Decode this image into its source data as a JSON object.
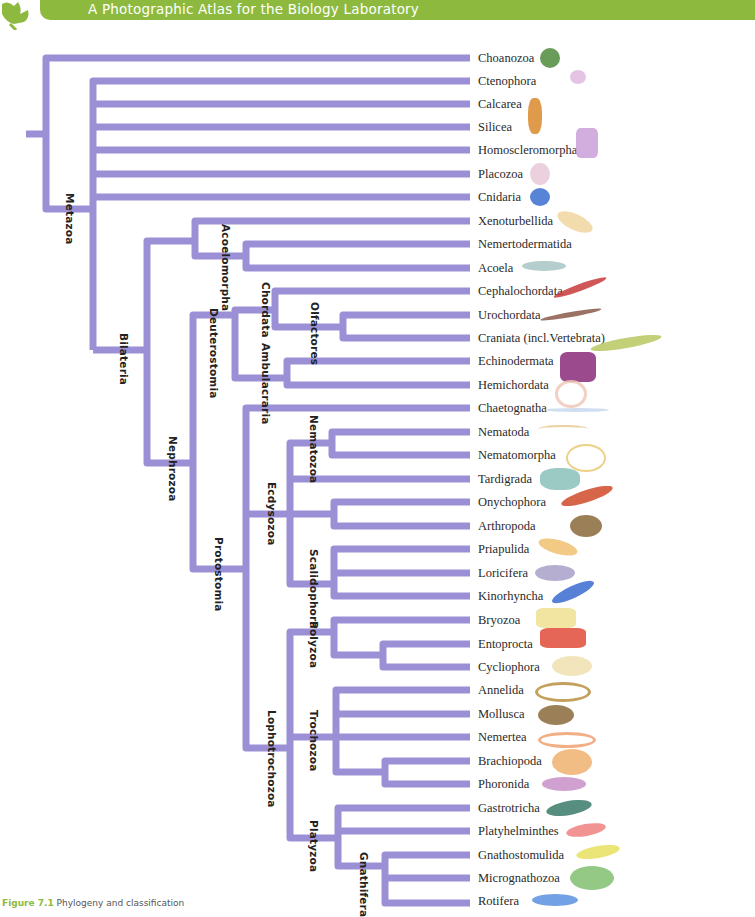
{
  "header": {
    "title": "A Photographic Atlas for the Biology Laboratory",
    "color": "#8dba3e"
  },
  "tree": {
    "line_color": "#9b8fd6",
    "taxa": [
      {
        "name": "Choanozoa",
        "y": 58,
        "icon_color": "#4f8a3c"
      },
      {
        "name": "Ctenophora",
        "y": 81,
        "icon_color": "#d9a6d8"
      },
      {
        "name": "Calcarea",
        "y": 104,
        "icon_color": "#d98a2b"
      },
      {
        "name": "Silicea",
        "y": 127,
        "icon_color": "#d98a2b"
      },
      {
        "name": "Homoscleromorpha",
        "y": 150,
        "icon_color": "#c9a0d8"
      },
      {
        "name": "Placozoa",
        "y": 174,
        "icon_color": "#e8c8d8"
      },
      {
        "name": "Cnidaria",
        "y": 197,
        "icon_color": "#3a6fd0"
      },
      {
        "name": "Xenoturbellida",
        "y": 221,
        "icon_color": "#f0d6a0"
      },
      {
        "name": "Nemertodermatida",
        "y": 244,
        "icon_color": "#f0d6a0"
      },
      {
        "name": "Acoela",
        "y": 268,
        "icon_color": "#a8c4c4"
      },
      {
        "name": "Cephalochordata",
        "y": 291,
        "icon_color": "#c83a3a"
      },
      {
        "name": "Urochordata",
        "y": 315,
        "icon_color": "#8a5a4a"
      },
      {
        "name": "Craniata (incl.Vertebrata)",
        "y": 338,
        "icon_color": "#b8c860"
      },
      {
        "name": "Echinodermata",
        "y": 361,
        "icon_color": "#8a2a7a"
      },
      {
        "name": "Hemichordata",
        "y": 385,
        "icon_color": "#f0c8b8"
      },
      {
        "name": "Chaetognatha",
        "y": 408,
        "icon_color": "#c8d8f0"
      },
      {
        "name": "Nematoda",
        "y": 432,
        "icon_color": "#e8c890"
      },
      {
        "name": "Nematomorpha",
        "y": 455,
        "icon_color": "#e8c870"
      },
      {
        "name": "Tardigrada",
        "y": 479,
        "icon_color": "#8ac0b8"
      },
      {
        "name": "Onychophora",
        "y": 502,
        "icon_color": "#d04a2a"
      },
      {
        "name": "Arthropoda",
        "y": 526,
        "icon_color": "#8a6a3a"
      },
      {
        "name": "Priapulida",
        "y": 549,
        "icon_color": "#f0c070"
      },
      {
        "name": "Loricifera",
        "y": 573,
        "icon_color": "#a8a0c8"
      },
      {
        "name": "Kinorhyncha",
        "y": 596,
        "icon_color": "#3a6ad0"
      },
      {
        "name": "Bryozoa",
        "y": 620,
        "icon_color": "#f0e090"
      },
      {
        "name": "Entoprocta",
        "y": 644,
        "icon_color": "#e04a3a"
      },
      {
        "name": "Cycliophora",
        "y": 667,
        "icon_color": "#f0e0b0"
      },
      {
        "name": "Annelida",
        "y": 690,
        "icon_color": "#b89040"
      },
      {
        "name": "Mollusca",
        "y": 714,
        "icon_color": "#8a6a3a"
      },
      {
        "name": "Nemertea",
        "y": 737,
        "icon_color": "#f0a070"
      },
      {
        "name": "Brachiopoda",
        "y": 761,
        "icon_color": "#f0b070"
      },
      {
        "name": "Phoronida",
        "y": 784,
        "icon_color": "#c890c8"
      },
      {
        "name": "Gastrotricha",
        "y": 808,
        "icon_color": "#3a7a6a"
      },
      {
        "name": "Platyhelminthes",
        "y": 831,
        "icon_color": "#f08080"
      },
      {
        "name": "Gnathostomulida",
        "y": 855,
        "icon_color": "#e8e060"
      },
      {
        "name": "Micrognathozoa",
        "y": 878,
        "icon_color": "#80c070"
      },
      {
        "name": "Rotifera",
        "y": 901,
        "icon_color": "#5a90e0"
      }
    ],
    "clades": [
      {
        "name": "Metazoa",
        "x": 63,
        "y": 198
      },
      {
        "name": "Bilateria",
        "x": 125,
        "y": 330
      },
      {
        "name": "Acoelomorpha",
        "x": 226,
        "y": 221
      },
      {
        "name": "Nephrozoa",
        "x": 175,
        "y": 453
      },
      {
        "name": "Deuterostomia",
        "x": 218,
        "y": 306
      },
      {
        "name": "Chordata",
        "x": 267,
        "y": 277
      },
      {
        "name": "Ambulacraria",
        "x": 267,
        "y": 344
      },
      {
        "name": "Olfactores",
        "x": 318,
        "y": 302
      },
      {
        "name": "Protostomia",
        "x": 225,
        "y": 537
      },
      {
        "name": "Nematozoa",
        "x": 318,
        "y": 412
      },
      {
        "name": "Ecdysozoa",
        "x": 276,
        "y": 465
      },
      {
        "name": "Scalidophora",
        "x": 318,
        "y": 540
      },
      {
        "name": "Polyzoa",
        "x": 318,
        "y": 621
      },
      {
        "name": "Lophotrochozoa",
        "x": 276,
        "y": 707
      },
      {
        "name": "Trochozoa",
        "x": 318,
        "y": 710
      },
      {
        "name": "Platyzoa",
        "x": 318,
        "y": 820
      },
      {
        "name": "Gnathifera",
        "x": 367,
        "y": 852
      }
    ]
  },
  "caption": {
    "label": "Figure 7.1",
    "text": "Phylogeny and classification"
  }
}
